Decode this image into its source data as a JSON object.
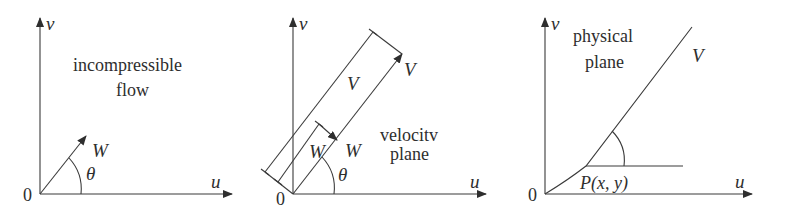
{
  "figure": {
    "panels": [
      {
        "id": "incompressible",
        "origin_label": "0",
        "x_axis_label": "u",
        "y_axis_label": "v",
        "title_lines": [
          "incompressible",
          "flow"
        ],
        "vector_label": "W",
        "angle_label": "θ"
      },
      {
        "id": "velocity",
        "origin_label": "0",
        "x_axis_label": "u",
        "y_axis_label": "v",
        "title_lines": [
          "velocitv",
          "plane"
        ],
        "outer_vector_label": "V",
        "outer_dimension_label": "V",
        "inner_vector_label": "W",
        "inner_dimension_label": "W",
        "angle_label": "θ"
      },
      {
        "id": "physical",
        "origin_label": "0",
        "x_axis_label": "u",
        "title_lines": [
          "physical",
          "plane"
        ],
        "y_axis_label": "v",
        "streamline_label": "V",
        "point_label": "P(x, y)"
      }
    ],
    "colors": {
      "line": "#3a3a3a",
      "text": "#2e2e2e",
      "background": "#ffffff"
    }
  }
}
